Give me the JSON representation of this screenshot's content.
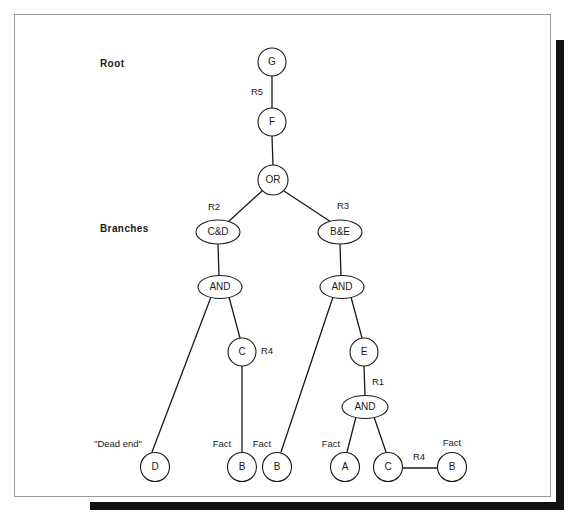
{
  "figure": {
    "type": "and-or-search-tree-diagram",
    "side_labels": [
      {
        "id": "root",
        "text": "Root",
        "x": 100,
        "y": 58
      },
      {
        "id": "branches",
        "text": "Branches",
        "x": 100,
        "y": 223
      }
    ],
    "colors": {
      "stroke": "#1a1a1a",
      "node_fill": "#ffffff",
      "frame_border": "#9a9a9a",
      "shadow": "#111111",
      "background": "#ffffff"
    },
    "nodes": [
      {
        "id": "G",
        "label": "G",
        "shape": "circle",
        "cx": 272,
        "cy": 62,
        "rx": 14,
        "ry": 14
      },
      {
        "id": "F",
        "label": "F",
        "shape": "circle",
        "cx": 272,
        "cy": 122,
        "rx": 14,
        "ry": 14
      },
      {
        "id": "OR",
        "label": "OR",
        "shape": "circle",
        "cx": 273,
        "cy": 180,
        "rx": 15,
        "ry": 15
      },
      {
        "id": "CD",
        "label": "C&D",
        "shape": "ellipse",
        "cx": 218,
        "cy": 232,
        "rx": 22,
        "ry": 12
      },
      {
        "id": "BE",
        "label": "B&E",
        "shape": "ellipse",
        "cx": 340,
        "cy": 232,
        "rx": 22,
        "ry": 12
      },
      {
        "id": "AND_L",
        "label": "AND",
        "shape": "ellipse",
        "cx": 220,
        "cy": 287,
        "rx": 22,
        "ry": 11.5
      },
      {
        "id": "AND_R",
        "label": "AND",
        "shape": "ellipse",
        "cx": 342,
        "cy": 287,
        "rx": 22,
        "ry": 11.5
      },
      {
        "id": "C_mid",
        "label": "C",
        "shape": "circle",
        "cx": 242,
        "cy": 352,
        "rx": 14,
        "ry": 14
      },
      {
        "id": "E",
        "label": "E",
        "shape": "circle",
        "cx": 364,
        "cy": 352,
        "rx": 14,
        "ry": 14
      },
      {
        "id": "AND_B",
        "label": "AND",
        "shape": "ellipse",
        "cx": 365,
        "cy": 407,
        "rx": 23,
        "ry": 11.5
      },
      {
        "id": "D",
        "label": "D",
        "shape": "circle",
        "cx": 155,
        "cy": 467,
        "rx": 14.5,
        "ry": 14.5
      },
      {
        "id": "B1",
        "label": "B",
        "shape": "circle",
        "cx": 242,
        "cy": 467,
        "rx": 14.5,
        "ry": 14.5
      },
      {
        "id": "B2",
        "label": "B",
        "shape": "circle",
        "cx": 277,
        "cy": 467,
        "rx": 14.5,
        "ry": 14.5
      },
      {
        "id": "A",
        "label": "A",
        "shape": "circle",
        "cx": 345,
        "cy": 467,
        "rx": 14.5,
        "ry": 14.5
      },
      {
        "id": "C_bot",
        "label": "C",
        "shape": "circle",
        "cx": 388,
        "cy": 467,
        "rx": 14.5,
        "ry": 14.5
      },
      {
        "id": "B3",
        "label": "B",
        "shape": "circle",
        "cx": 452,
        "cy": 467,
        "rx": 14.5,
        "ry": 14.5
      }
    ],
    "edges": [
      {
        "id": "G-F",
        "x1": 272,
        "y1": 76,
        "x2": 272,
        "y2": 108
      },
      {
        "id": "F-OR",
        "x1": 272,
        "y1": 136,
        "x2": 273,
        "y2": 165
      },
      {
        "id": "OR-CD",
        "x1": 262,
        "y1": 191,
        "x2": 228,
        "y2": 222
      },
      {
        "id": "OR-BE",
        "x1": 284,
        "y1": 191,
        "x2": 331,
        "y2": 222
      },
      {
        "id": "CD-ANDL",
        "x1": 218,
        "y1": 244,
        "x2": 219,
        "y2": 276
      },
      {
        "id": "BE-ANDR",
        "x1": 340,
        "y1": 244,
        "x2": 341,
        "y2": 276
      },
      {
        "id": "ANDL-D",
        "x1": 211,
        "y1": 297,
        "x2": 152,
        "y2": 452
      },
      {
        "id": "ANDL-Cmid",
        "x1": 229,
        "y1": 297,
        "x2": 240,
        "y2": 338
      },
      {
        "id": "Cmid-B1",
        "x1": 242,
        "y1": 366,
        "x2": 242,
        "y2": 452
      },
      {
        "id": "ANDR-B2",
        "x1": 333,
        "y1": 297,
        "x2": 281,
        "y2": 452
      },
      {
        "id": "ANDR-E",
        "x1": 351,
        "y1": 297,
        "x2": 362,
        "y2": 338
      },
      {
        "id": "E-ANDB",
        "x1": 364,
        "y1": 366,
        "x2": 365,
        "y2": 396
      },
      {
        "id": "ANDB-A",
        "x1": 356,
        "y1": 417,
        "x2": 347,
        "y2": 452
      },
      {
        "id": "ANDB-Cbot",
        "x1": 374,
        "y1": 417,
        "x2": 386,
        "y2": 452
      },
      {
        "id": "Cbot-B3",
        "x1": 403,
        "y1": 468,
        "x2": 438,
        "y2": 468
      }
    ],
    "edge_labels": [
      {
        "id": "R5",
        "text": "R5",
        "x": 257,
        "y": 92
      },
      {
        "id": "R2",
        "text": "R2",
        "x": 214,
        "y": 207
      },
      {
        "id": "R3",
        "text": "R3",
        "x": 343,
        "y": 206
      },
      {
        "id": "R4_mid",
        "text": "R4",
        "x": 267,
        "y": 351
      },
      {
        "id": "R1",
        "text": "R1",
        "x": 378,
        "y": 382
      },
      {
        "id": "R4_bot",
        "text": "R4",
        "x": 419,
        "y": 457
      },
      {
        "id": "dead_end",
        "text": "\"Dead end\"",
        "x": 118,
        "y": 444
      },
      {
        "id": "fact_B1",
        "text": "Fact",
        "x": 222,
        "y": 444
      },
      {
        "id": "fact_B2",
        "text": "Fact",
        "x": 262,
        "y": 444
      },
      {
        "id": "fact_A",
        "text": "Fact",
        "x": 331,
        "y": 444
      },
      {
        "id": "fact_B3",
        "text": "Fact",
        "x": 452,
        "y": 443
      }
    ]
  }
}
